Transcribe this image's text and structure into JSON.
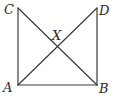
{
  "diagram": {
    "type": "geometry",
    "points": {
      "C": {
        "label": "C",
        "x": 18,
        "y": 8,
        "label_x": 4,
        "label_y": 14
      },
      "D": {
        "label": "D",
        "x": 97,
        "y": 8,
        "label_x": 99,
        "label_y": 15
      },
      "A": {
        "label": "A",
        "x": 18,
        "y": 85,
        "label_x": 3,
        "label_y": 92
      },
      "B": {
        "label": "B",
        "x": 97,
        "y": 85,
        "label_x": 99,
        "label_y": 93
      },
      "X": {
        "label": "X",
        "x": 57,
        "y": 47,
        "label_x": 52,
        "label_y": 40
      }
    },
    "segments": [
      {
        "name": "CA",
        "from": "C",
        "to": "A"
      },
      {
        "name": "DB",
        "from": "D",
        "to": "B"
      },
      {
        "name": "AB",
        "from": "A",
        "to": "B"
      },
      {
        "name": "CB",
        "from": "C",
        "to": "B"
      },
      {
        "name": "AD",
        "from": "A",
        "to": "D"
      }
    ],
    "colors": {
      "line": "#3a3a3a",
      "label": "#2a2a2a",
      "background": "#ffffff"
    }
  }
}
